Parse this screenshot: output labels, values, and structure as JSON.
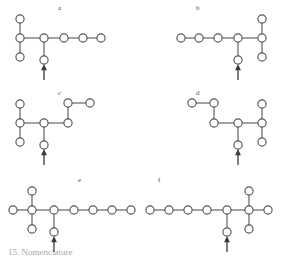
{
  "figure": {
    "type": "chemical-structure-diagram-set",
    "background_color": "#ffffff",
    "node_stroke_color": "#555555",
    "node_fill_color": "#ffffff",
    "bond_color": "#6a6a6a",
    "arrow_color": "#3a3a3a",
    "label_color": "#4a4a4a",
    "partial_caption": "15. Nomenclature",
    "panels": [
      {
        "id": "a",
        "label": "a",
        "label_x": 58,
        "label_y": 4,
        "description": "branched chain with arrow marking a substituent position",
        "nodes": [
          {
            "id": "a1",
            "x": 20,
            "y": 19
          },
          {
            "id": "a2",
            "x": 20,
            "y": 38
          },
          {
            "id": "a3",
            "x": 20,
            "y": 57
          },
          {
            "id": "a4",
            "x": 44,
            "y": 38
          },
          {
            "id": "a5",
            "x": 44,
            "y": 60
          },
          {
            "id": "a6",
            "x": 64,
            "y": 38
          },
          {
            "id": "a7",
            "x": 83,
            "y": 38
          },
          {
            "id": "a8",
            "x": 101,
            "y": 38
          }
        ],
        "bonds": [
          [
            "a1",
            "a2"
          ],
          [
            "a2",
            "a3"
          ],
          [
            "a2",
            "a4"
          ],
          [
            "a4",
            "a5"
          ],
          [
            "a4",
            "a6"
          ],
          [
            "a6",
            "a7"
          ],
          [
            "a7",
            "a8"
          ]
        ],
        "arrow": {
          "x": 44,
          "y_from": 80,
          "y_to": 64
        }
      },
      {
        "id": "b",
        "label": "b",
        "label_x": 196,
        "label_y": 4,
        "description": "mirror image of panel a",
        "nodes": [
          {
            "id": "b1",
            "x": 122,
            "y": 19
          },
          {
            "id": "b2",
            "x": 122,
            "y": 38
          },
          {
            "id": "b3",
            "x": 122,
            "y": 57
          },
          {
            "id": "b4",
            "x": 98,
            "y": 38
          },
          {
            "id": "b5",
            "x": 98,
            "y": 60
          },
          {
            "id": "b6",
            "x": 78,
            "y": 38
          },
          {
            "id": "b7",
            "x": 59,
            "y": 38
          },
          {
            "id": "b8",
            "x": 41,
            "y": 38
          }
        ],
        "bonds": [
          [
            "b1",
            "b2"
          ],
          [
            "b2",
            "b3"
          ],
          [
            "b2",
            "b4"
          ],
          [
            "b4",
            "b5"
          ],
          [
            "b4",
            "b6"
          ],
          [
            "b6",
            "b7"
          ],
          [
            "b7",
            "b8"
          ]
        ],
        "arrow": {
          "x": 98,
          "y_from": 80,
          "y_to": 64
        }
      },
      {
        "id": "c",
        "label": "c",
        "label_x": 58,
        "label_y": 89,
        "description": "chain with stepped upper-right branch",
        "nodes": [
          {
            "id": "c1",
            "x": 20,
            "y": 19
          },
          {
            "id": "c2",
            "x": 20,
            "y": 38
          },
          {
            "id": "c3",
            "x": 20,
            "y": 57
          },
          {
            "id": "c4",
            "x": 44,
            "y": 38
          },
          {
            "id": "c5",
            "x": 44,
            "y": 60
          },
          {
            "id": "c6",
            "x": 68,
            "y": 38
          },
          {
            "id": "c7",
            "x": 68,
            "y": 18
          },
          {
            "id": "c8",
            "x": 90,
            "y": 18
          }
        ],
        "bonds": [
          [
            "c1",
            "c2"
          ],
          [
            "c2",
            "c3"
          ],
          [
            "c2",
            "c4"
          ],
          [
            "c4",
            "c5"
          ],
          [
            "c4",
            "c6"
          ],
          [
            "c6",
            "c7"
          ],
          [
            "c7",
            "c8"
          ]
        ],
        "arrow": {
          "x": 44,
          "y_from": 80,
          "y_to": 64
        }
      },
      {
        "id": "d",
        "label": "d",
        "label_x": 196,
        "label_y": 89,
        "description": "mirror image of panel c",
        "nodes": [
          {
            "id": "d1",
            "x": 122,
            "y": 19
          },
          {
            "id": "d2",
            "x": 122,
            "y": 38
          },
          {
            "id": "d3",
            "x": 122,
            "y": 57
          },
          {
            "id": "d4",
            "x": 98,
            "y": 38
          },
          {
            "id": "d5",
            "x": 98,
            "y": 60
          },
          {
            "id": "d6",
            "x": 74,
            "y": 38
          },
          {
            "id": "d7",
            "x": 74,
            "y": 18
          },
          {
            "id": "d8",
            "x": 52,
            "y": 18
          }
        ],
        "bonds": [
          [
            "d1",
            "d2"
          ],
          [
            "d2",
            "d3"
          ],
          [
            "d2",
            "d4"
          ],
          [
            "d4",
            "d5"
          ],
          [
            "d4",
            "d6"
          ],
          [
            "d6",
            "d7"
          ],
          [
            "d7",
            "d8"
          ]
        ],
        "arrow": {
          "x": 98,
          "y_from": 80,
          "y_to": 64
        }
      },
      {
        "id": "e",
        "label": "e",
        "label_x": 78,
        "label_y": 176,
        "description": "long chain with quaternary cross centre on the left",
        "nodes": [
          {
            "id": "e1",
            "x": 32,
            "y": 19
          },
          {
            "id": "e2",
            "x": 32,
            "y": 38
          },
          {
            "id": "e3",
            "x": 32,
            "y": 57
          },
          {
            "id": "e4",
            "x": 13,
            "y": 38
          },
          {
            "id": "e5",
            "x": 54,
            "y": 38
          },
          {
            "id": "e6",
            "x": 54,
            "y": 60
          },
          {
            "id": "e7",
            "x": 74,
            "y": 38
          },
          {
            "id": "e8",
            "x": 93,
            "y": 38
          },
          {
            "id": "e9",
            "x": 112,
            "y": 38
          },
          {
            "id": "e10",
            "x": 131,
            "y": 38
          }
        ],
        "bonds": [
          [
            "e1",
            "e2"
          ],
          [
            "e2",
            "e3"
          ],
          [
            "e2",
            "e4"
          ],
          [
            "e2",
            "e5"
          ],
          [
            "e5",
            "e6"
          ],
          [
            "e5",
            "e7"
          ],
          [
            "e7",
            "e8"
          ],
          [
            "e8",
            "e9"
          ],
          [
            "e9",
            "e10"
          ]
        ],
        "arrow": {
          "x": 54,
          "y_from": 80,
          "y_to": 64
        }
      },
      {
        "id": "f",
        "label": "f",
        "label_x": 158,
        "label_y": 176,
        "description": "mirror image of panel e",
        "nodes": [
          {
            "id": "f1",
            "x": 109,
            "y": 19
          },
          {
            "id": "f2",
            "x": 109,
            "y": 38
          },
          {
            "id": "f3",
            "x": 109,
            "y": 57
          },
          {
            "id": "f4",
            "x": 128,
            "y": 38
          },
          {
            "id": "f5",
            "x": 87,
            "y": 38
          },
          {
            "id": "f6",
            "x": 87,
            "y": 60
          },
          {
            "id": "f7",
            "x": 67,
            "y": 38
          },
          {
            "id": "f8",
            "x": 48,
            "y": 38
          },
          {
            "id": "f9",
            "x": 29,
            "y": 38
          },
          {
            "id": "f10",
            "x": 10,
            "y": 38
          }
        ],
        "bonds": [
          [
            "f1",
            "f2"
          ],
          [
            "f2",
            "f3"
          ],
          [
            "f2",
            "f4"
          ],
          [
            "f2",
            "f5"
          ],
          [
            "f5",
            "f6"
          ],
          [
            "f5",
            "f7"
          ],
          [
            "f7",
            "f8"
          ],
          [
            "f8",
            "f9"
          ],
          [
            "f9",
            "f10"
          ]
        ],
        "arrow": {
          "x": 87,
          "y_from": 80,
          "y_to": 64
        }
      }
    ],
    "panel_positions": [
      {
        "id": "a",
        "left": 0,
        "top": 0
      },
      {
        "id": "b",
        "left": 140,
        "top": 0
      },
      {
        "id": "c",
        "left": 0,
        "top": 85
      },
      {
        "id": "d",
        "left": 140,
        "top": 85
      },
      {
        "id": "e",
        "left": 0,
        "top": 172
      },
      {
        "id": "f",
        "left": 140,
        "top": 172
      }
    ]
  }
}
